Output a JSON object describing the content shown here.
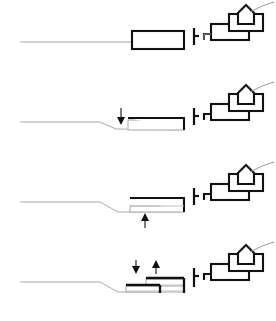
{
  "figure": {
    "panel_count": 4,
    "background_color": "#ffffff",
    "line_color": "#111111",
    "terrain_color": "#a8a8a8",
    "width": 276,
    "height": 321
  },
  "panels": [
    {
      "id": "panel-1",
      "label": "Variant 1 - baseline volume on flat grade",
      "index": "1",
      "terrain": {
        "description": "flat ground line running left to right",
        "points": "20,42 132,42"
      },
      "volume": {
        "name": "main-volume",
        "x": 132,
        "y": 31,
        "w": 52,
        "h": 18
      },
      "post": {
        "x": 172,
        "y_top": 28,
        "y_bottom": 44
      },
      "neighbors": [
        {
          "name": "low-block",
          "x": 196,
          "y": 25,
          "w": 40,
          "h": 16
        },
        {
          "name": "mid-block",
          "x": 214,
          "y": 17,
          "w": 34,
          "h": 16
        },
        {
          "name": "gable-house",
          "x": 228,
          "y": 8,
          "w": 22,
          "h": 22
        }
      ],
      "arrows": []
    },
    {
      "id": "panel-2",
      "label": "Variant 2 - volume lowered into slope",
      "index": "2",
      "terrain": {
        "description": "ground line steps down before the volume",
        "points": "20,42 100,42 116,49 132,50"
      },
      "volume": {
        "name": "main-volume",
        "x": 132,
        "y": 36,
        "w": 52,
        "h": 14
      },
      "post": {
        "x": 172,
        "y_top": 28,
        "y_bottom": 44
      },
      "neighbors": [
        {
          "name": "low-block",
          "x": 196,
          "y": 25,
          "w": 40,
          "h": 16
        },
        {
          "name": "mid-block",
          "x": 214,
          "y": 17,
          "w": 34,
          "h": 16
        },
        {
          "name": "gable-house",
          "x": 228,
          "y": 8,
          "w": 22,
          "h": 22
        }
      ],
      "arrows": [
        {
          "name": "down-arrow",
          "direction": "down",
          "x": 121,
          "y_top": 31,
          "y_bottom": 44
        }
      ]
    },
    {
      "id": "panel-3",
      "label": "Variant 3 - volume raised above lowered grade",
      "index": "3",
      "terrain": {
        "description": "ground line steps down and continues under the volume",
        "points": "20,42 100,42 116,52 184,52"
      },
      "volume": {
        "name": "main-volume",
        "x": 132,
        "y": 37,
        "w": 52,
        "h": 14
      },
      "post": {
        "x": 172,
        "y_top": 28,
        "y_bottom": 44
      },
      "neighbors": [
        {
          "name": "low-block",
          "x": 196,
          "y": 25,
          "w": 40,
          "h": 16
        },
        {
          "name": "mid-block",
          "x": 214,
          "y": 17,
          "w": 34,
          "h": 16
        },
        {
          "name": "gable-house",
          "x": 228,
          "y": 8,
          "w": 22,
          "h": 22
        }
      ],
      "arrows": [
        {
          "name": "up-arrow",
          "direction": "up",
          "x": 145,
          "y_top": 55,
          "y_bottom": 68
        }
      ]
    },
    {
      "id": "panel-4",
      "label": "Variant 4 - split-level volume, one part lowered one raised",
      "index": "4",
      "terrain": {
        "description": "ground line steps down and continues under the split volume",
        "points": "20,42 100,42 118,52 184,52"
      },
      "volume": {
        "name": "split-volume",
        "upper": {
          "x": 148,
          "y": 35,
          "w": 36,
          "h": 10
        },
        "lower": {
          "x": 126,
          "y": 43,
          "w": 34,
          "h": 9
        }
      },
      "post": {
        "x": 172,
        "y_top": 28,
        "y_bottom": 46
      },
      "neighbors": [
        {
          "name": "low-block",
          "x": 196,
          "y": 25,
          "w": 40,
          "h": 16
        },
        {
          "name": "mid-block",
          "x": 214,
          "y": 17,
          "w": 34,
          "h": 16
        },
        {
          "name": "gable-house",
          "x": 228,
          "y": 8,
          "w": 22,
          "h": 22
        }
      ],
      "arrows": [
        {
          "name": "down-arrow",
          "direction": "down",
          "x": 136,
          "y_top": 20,
          "y_bottom": 33
        },
        {
          "name": "up-arrow",
          "direction": "up",
          "x": 155,
          "y_top": 20,
          "y_bottom": 33
        }
      ]
    }
  ]
}
